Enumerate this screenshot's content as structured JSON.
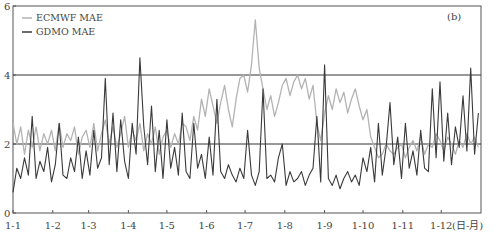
{
  "chart_data": {
    "type": "line",
    "title": "",
    "panel_label": "(b)",
    "xlabel": "(日-月)",
    "ylabel": "",
    "ylim": [
      0,
      6
    ],
    "yticks": [
      0,
      2,
      4,
      6
    ],
    "ytick_labels": [
      "0",
      "2",
      "4",
      "6"
    ],
    "reference_lines": [
      2,
      4
    ],
    "grid": false,
    "legend_position": "upper-left",
    "x_ticks": [
      "1-1",
      "1-2",
      "1-3",
      "1-4",
      "1-5",
      "1-6",
      "1-7",
      "1-8",
      "1-9",
      "1-10",
      "1-11",
      "1-12"
    ],
    "x_unit_label": "(日-月)",
    "x_range_days": [
      0,
      365
    ],
    "sample_step_days": 3,
    "series": [
      {
        "name": "ECMWF MAE",
        "color": "#b3b3b3",
        "values": [
          2.6,
          2.0,
          2.5,
          1.7,
          2.4,
          1.9,
          2.5,
          1.8,
          2.3,
          2.0,
          2.4,
          1.8,
          2.6,
          1.9,
          2.3,
          2.1,
          2.5,
          1.7,
          2.2,
          2.4,
          1.9,
          2.6,
          1.8,
          2.3,
          2.7,
          2.0,
          2.5,
          1.9,
          2.3,
          2.8,
          1.9,
          2.4,
          2.1,
          2.6,
          1.8,
          2.3,
          2.0,
          2.5,
          1.7,
          2.2,
          2.4,
          1.9,
          2.3,
          2.0,
          2.6,
          2.5,
          2.1,
          2.8,
          2.4,
          3.3,
          2.8,
          3.6,
          3.1,
          2.6,
          3.2,
          3.7,
          3.0,
          2.5,
          3.3,
          3.9,
          4.0,
          3.5,
          4.3,
          5.6,
          4.2,
          3.6,
          3.0,
          3.4,
          2.8,
          3.2,
          3.7,
          3.9,
          3.4,
          3.8,
          4.0,
          3.6,
          3.9,
          3.3,
          3.7,
          2.6,
          2.1,
          2.9,
          3.4,
          3.0,
          3.6,
          3.2,
          3.5,
          2.9,
          3.3,
          3.6,
          3.1,
          2.7,
          3.0,
          2.2,
          1.9,
          1.6,
          1.7,
          2.0,
          1.8,
          1.7,
          1.9,
          2.0,
          1.6,
          1.9,
          2.1,
          1.8,
          2.2,
          1.7,
          2.0,
          1.9,
          2.3,
          2.1,
          1.8,
          2.2,
          2.0,
          1.7,
          2.1,
          1.9,
          2.3,
          2.0,
          2.2,
          1.9
        ]
      },
      {
        "name": "GDMO MAE",
        "color": "#3a3a3a",
        "values": [
          0.6,
          1.3,
          1.0,
          1.6,
          1.1,
          2.8,
          1.0,
          1.5,
          1.2,
          1.9,
          0.9,
          1.4,
          2.6,
          1.1,
          1.0,
          1.6,
          1.2,
          2.2,
          1.0,
          1.8,
          1.1,
          2.4,
          1.3,
          1.6,
          3.9,
          1.4,
          2.9,
          1.2,
          2.7,
          1.5,
          1.0,
          2.6,
          1.7,
          4.5,
          2.5,
          1.4,
          3.1,
          1.2,
          2.4,
          1.0,
          2.7,
          1.3,
          1.9,
          1.1,
          2.9,
          1.2,
          1.0,
          2.6,
          1.3,
          1.7,
          1.0,
          2.2,
          1.1,
          3.3,
          1.2,
          1.0,
          1.4,
          1.1,
          0.9,
          1.3,
          1.0,
          2.4,
          1.1,
          0.8,
          1.2,
          3.6,
          1.0,
          1.1,
          0.9,
          1.6,
          2.0,
          0.8,
          1.2,
          0.9,
          1.0,
          1.2,
          0.8,
          1.1,
          1.3,
          2.8,
          0.9,
          4.3,
          1.0,
          0.8,
          1.1,
          0.7,
          1.0,
          1.2,
          0.9,
          1.1,
          0.8,
          1.6,
          1.2,
          1.9,
          0.9,
          2.6,
          1.1,
          1.9,
          3.2,
          1.4,
          2.2,
          1.0,
          2.6,
          1.3,
          1.8,
          1.1,
          2.4,
          1.3,
          1.2,
          3.6,
          1.6,
          3.8,
          1.5,
          2.9,
          1.4,
          2.5,
          1.9,
          3.4,
          1.8,
          4.2,
          1.7,
          2.9
        ]
      }
    ]
  }
}
